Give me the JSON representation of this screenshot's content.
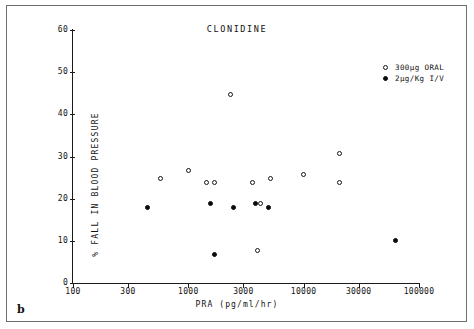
{
  "figure": {
    "panel_letter": "b",
    "title": "CLONIDINE"
  },
  "chart_data": {
    "type": "scatter",
    "title": "CLONIDINE",
    "xlabel": "PRA (pg/ml/hr)",
    "ylabel": "% FALL IN BLOOD PRESSURE",
    "xscale": "log",
    "yscale": "linear",
    "xlim": [
      100,
      100000
    ],
    "ylim": [
      0,
      60
    ],
    "xticks": [
      100,
      300,
      1000,
      3000,
      10000,
      30000,
      100000
    ],
    "xticklabels": [
      "100",
      "300",
      "1000",
      "3000",
      "10000",
      "30000",
      "100000"
    ],
    "yticks": [
      0,
      10,
      20,
      30,
      40,
      50,
      60
    ],
    "yticklabels": [
      "0",
      "10",
      "20",
      "30",
      "40",
      "50",
      "60"
    ],
    "grid": false,
    "legend_position": "upper right",
    "series": [
      {
        "name": "300µg ORAL",
        "marker": "open-circle",
        "color": "#111111",
        "points": [
          {
            "x": 570,
            "y": 24.7
          },
          {
            "x": 1000,
            "y": 26.7
          },
          {
            "x": 1450,
            "y": 23.8
          },
          {
            "x": 1680,
            "y": 23.8
          },
          {
            "x": 2300,
            "y": 44.6
          },
          {
            "x": 3600,
            "y": 23.8
          },
          {
            "x": 4250,
            "y": 18.9
          },
          {
            "x": 4000,
            "y": 7.8
          },
          {
            "x": 5200,
            "y": 24.7
          },
          {
            "x": 10000,
            "y": 25.7
          },
          {
            "x": 20500,
            "y": 30.8
          },
          {
            "x": 20500,
            "y": 23.8
          }
        ]
      },
      {
        "name": "2µg/Kg I/V",
        "marker": "filled-circle",
        "color": "#0b0b0b",
        "points": [
          {
            "x": 440,
            "y": 17.8
          },
          {
            "x": 1550,
            "y": 18.9
          },
          {
            "x": 1700,
            "y": 6.8
          },
          {
            "x": 2450,
            "y": 17.8
          },
          {
            "x": 3800,
            "y": 18.9
          },
          {
            "x": 5000,
            "y": 17.8
          },
          {
            "x": 62000,
            "y": 10.0
          }
        ]
      }
    ],
    "legend": [
      {
        "label": "300µg ORAL",
        "marker": "open-circle"
      },
      {
        "label": "2µg/Kg I/V",
        "marker": "filled-circle"
      }
    ]
  }
}
